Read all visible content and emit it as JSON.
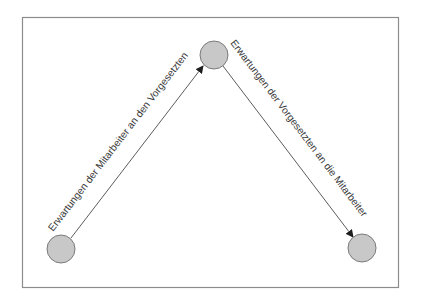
{
  "diagram": {
    "type": "directed-graph",
    "frame": {
      "x": 22,
      "y": 17,
      "width": 377,
      "height": 271,
      "stroke": "#8c8c8c"
    },
    "colors": {
      "node_fill": "#c8c8c8",
      "node_stroke": "#7a7a7a",
      "edge_stroke": "#4a4a4a",
      "label_text": "#3a3a3a"
    },
    "nodes": [
      {
        "id": "mitarbeiter-left",
        "cx": 61,
        "cy": 249,
        "r": 14
      },
      {
        "id": "vorgesetzte-top",
        "cx": 214,
        "cy": 55,
        "r": 14
      },
      {
        "id": "mitarbeiter-right",
        "cx": 362,
        "cy": 248,
        "r": 14
      }
    ],
    "edges": [
      {
        "from": "mitarbeiter-left",
        "to": "vorgesetzte-top",
        "label": "Erwartungen der Mitarbeiter an den Vorgesetzten"
      },
      {
        "from": "vorgesetzte-top",
        "to": "mitarbeiter-right",
        "label": "Erwartungen der Vorgesetzten an die Mitarbeiter"
      }
    ]
  }
}
